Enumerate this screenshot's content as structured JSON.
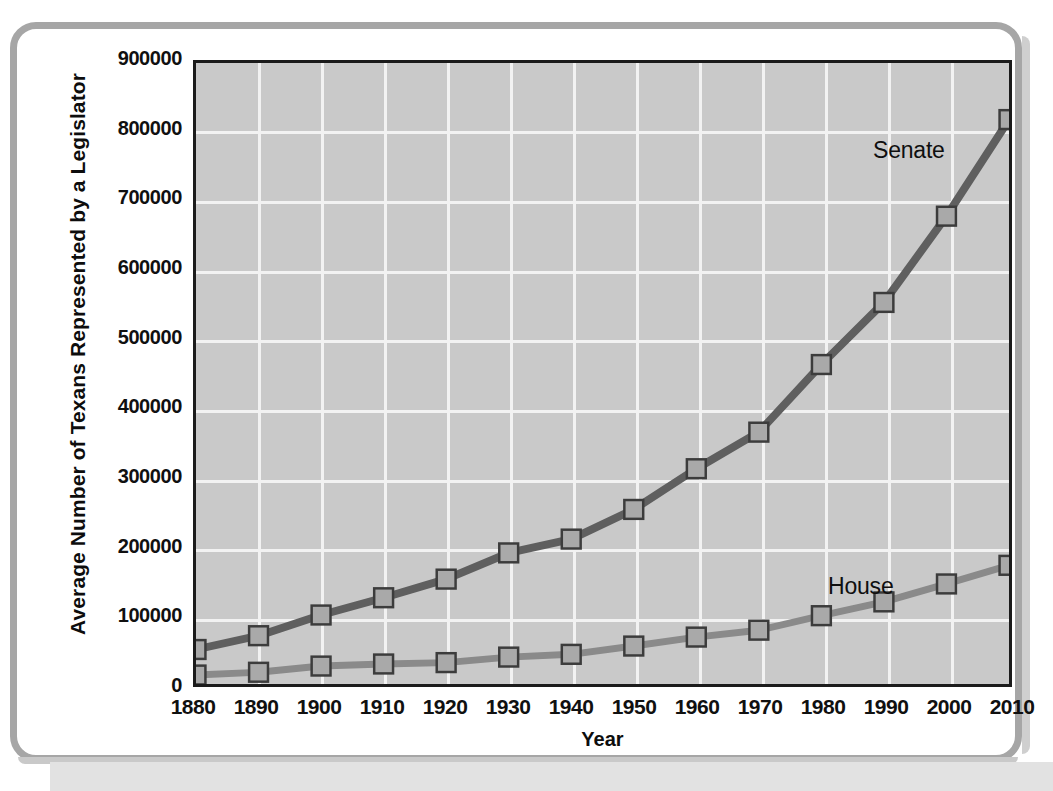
{
  "chart_data": {
    "type": "line",
    "title": "",
    "xlabel": "Year",
    "ylabel": "Average Number of Texans Represented by a Legislator",
    "x": [
      1880,
      1890,
      1900,
      1910,
      1920,
      1930,
      1940,
      1950,
      1960,
      1970,
      1980,
      1990,
      2000,
      2010
    ],
    "categories": [
      "1880",
      "1890",
      "1900",
      "1910",
      "1920",
      "1930",
      "1940",
      "1950",
      "1960",
      "1970",
      "1980",
      "1990",
      "2000",
      "2010"
    ],
    "xlim": [
      1880,
      2010
    ],
    "ylim": [
      0,
      900000
    ],
    "ytick_values": [
      0,
      100000,
      200000,
      300000,
      400000,
      500000,
      600000,
      700000,
      800000,
      900000
    ],
    "ytick_labels": [
      "0",
      "100000",
      "200000",
      "300000",
      "400000",
      "500000",
      "600000",
      "700000",
      "800000",
      "900000"
    ],
    "grid": true,
    "legend_position": "inline-annotations",
    "series": [
      {
        "name": "Senate",
        "color": "#5f5f5f",
        "marker": "square",
        "values": [
          50000,
          70000,
          100000,
          125000,
          152000,
          190000,
          210000,
          253000,
          312000,
          365000,
          463000,
          553000,
          678000,
          818000
        ]
      },
      {
        "name": "House",
        "color": "#8a8a8a",
        "marker": "square",
        "values": [
          13000,
          17000,
          26000,
          29000,
          31000,
          39000,
          43000,
          55000,
          68000,
          78000,
          99000,
          119000,
          145000,
          172000
        ]
      }
    ],
    "annotations": [
      {
        "text": "Senate",
        "series": "Senate"
      },
      {
        "text": "House",
        "series": "House"
      }
    ]
  },
  "style": {
    "plot_background": "#c9c9c9",
    "grid_color": "#f2f2f2",
    "axis_color": "#1b1b1b",
    "frame_color": "#a6a6a6",
    "marker_fill": "#a9a9a9",
    "marker_stroke": "#3c3c3c"
  }
}
